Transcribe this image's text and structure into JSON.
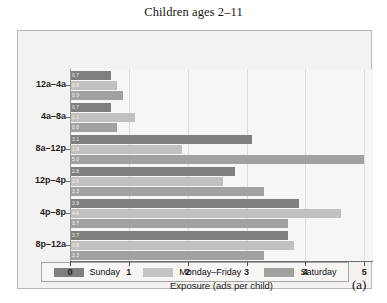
{
  "figure": {
    "panel_letter": "(a)"
  },
  "chart_data": {
    "type": "bar",
    "orientation": "horizontal",
    "title": "Children ages 2–11",
    "xlabel": "Exposure (ads per child)",
    "ylabel": "",
    "categories": [
      "12a–4a",
      "4a–8a",
      "8a–12p",
      "12p–4p",
      "4p–8p",
      "8p–12a"
    ],
    "series": [
      {
        "name": "Sunday",
        "color": "#817f7c",
        "values": [
          0.7,
          0.7,
          3.1,
          2.8,
          3.9,
          3.7
        ]
      },
      {
        "name": "Monday–Friday",
        "color": "#c2c0bc",
        "values": [
          0.8,
          1.1,
          1.9,
          2.6,
          4.6,
          3.8
        ]
      },
      {
        "name": "Saturday",
        "color": "#a3a19d",
        "values": [
          0.9,
          0.8,
          5.0,
          3.3,
          3.7,
          3.3
        ]
      }
    ],
    "xlim": [
      0,
      5.15
    ],
    "xticks": [
      0,
      1,
      2,
      3,
      4,
      5
    ],
    "xtick_labels": [
      "0",
      "1",
      "2",
      "3",
      "4",
      "5"
    ],
    "grid": true,
    "grid_axis": "x",
    "legend_position": "bottom",
    "value_labels": true
  }
}
